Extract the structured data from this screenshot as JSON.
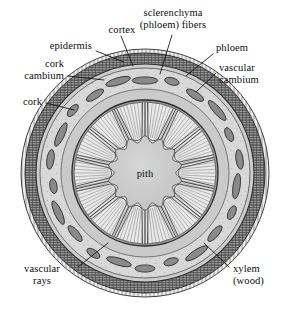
{
  "figure": {
    "background_color": "#ffffff",
    "ink_color": "#111111"
  },
  "diagram": {
    "type": "botanical-cross-section",
    "center": {
      "x": 145,
      "y": 173
    },
    "outer_radius": 124,
    "layers": [
      {
        "name": "epidermis",
        "outer_r": 124,
        "inner_r": 120,
        "fill": "#e8e8e8",
        "stroke": "#3a3a3a"
      },
      {
        "name": "cork",
        "outer_r": 120,
        "inner_r": 110,
        "fill": "#8f8f8f",
        "stroke": "#2c2c2c"
      },
      {
        "name": "cork-cambium",
        "outer_r": 110,
        "inner_r": 105,
        "fill": "#cfcfcf",
        "stroke": "#3a3a3a"
      },
      {
        "name": "cortex",
        "outer_r": 105,
        "inner_r": 84,
        "fill": "#d6d6d6",
        "stroke": "#4a4a4a"
      },
      {
        "name": "phloem",
        "outer_r": 84,
        "inner_r": 74,
        "fill": "#c6c6c6",
        "stroke": "#4a4a4a"
      },
      {
        "name": "vascular-cambium",
        "outer_r": 74,
        "inner_r": 71,
        "fill": "#9a9a9a",
        "stroke": "#333333"
      },
      {
        "name": "xylem",
        "outer_r": 71,
        "inner_r": 34,
        "fill": "#e4e4e4",
        "stroke": "#444444"
      },
      {
        "name": "pith",
        "outer_r": 34,
        "inner_r": 0,
        "fill": "#cbcbcb",
        "stroke": "#555555"
      }
    ],
    "fiber_bundles": {
      "count": 22,
      "fill": "#8a8a8a",
      "stroke": "#2e2e2e"
    },
    "xylem_wedges": {
      "count": 14
    },
    "vascular_rays": {
      "count": 120
    }
  },
  "labels": [
    {
      "id": "cortex",
      "text": "cortex",
      "align": "center"
    },
    {
      "id": "sclerenchyma",
      "text": "sclerenchyma\n(phloem) fibers",
      "align": "center"
    },
    {
      "id": "epidermis",
      "text": "epidermis",
      "align": "right"
    },
    {
      "id": "phloem",
      "text": "phloem",
      "align": "left"
    },
    {
      "id": "cork_cambium",
      "text": "cork\ncambium",
      "align": "right"
    },
    {
      "id": "vascular_cambium",
      "text": "vascular\ncambium",
      "align": "left"
    },
    {
      "id": "cork",
      "text": "cork",
      "align": "right"
    },
    {
      "id": "pith",
      "text": "pith",
      "align": "center"
    },
    {
      "id": "vascular_rays",
      "text": "vascular\nrays",
      "align": "center"
    },
    {
      "id": "xylem",
      "text": "xylem\n(wood)",
      "align": "left"
    }
  ]
}
